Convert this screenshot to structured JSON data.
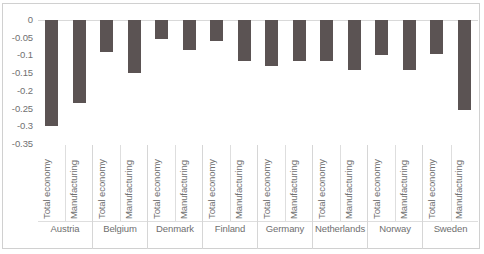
{
  "chart_data": {
    "type": "bar",
    "title": "",
    "subtitle": "",
    "xlabel": "",
    "ylabel": "",
    "ylim": [
      -0.35,
      0
    ],
    "yticks": [
      "0",
      "-0.05",
      "-0.1",
      "-0.15",
      "-0.2",
      "-0.25",
      "-0.3",
      "-0.35"
    ],
    "ytick_values": [
      0,
      -0.05,
      -0.1,
      -0.15,
      -0.2,
      -0.25,
      -0.3,
      -0.35
    ],
    "grid": false,
    "legend": "none",
    "bar_color": "#5b5353",
    "categories": [
      "Austria",
      "Belgium",
      "Denmark",
      "Finland",
      "Germany",
      "Netherlands",
      "Norway",
      "Sweden"
    ],
    "subcategories": [
      "Total economy",
      "Manufacturing"
    ],
    "series": [
      {
        "name": "Total economy",
        "values": [
          -0.3,
          -0.09,
          -0.055,
          -0.06,
          -0.13,
          -0.115,
          -0.1,
          -0.095
        ]
      },
      {
        "name": "Manufacturing",
        "values": [
          -0.235,
          -0.15,
          -0.085,
          -0.115,
          -0.115,
          -0.14,
          -0.14,
          -0.255
        ]
      }
    ],
    "groups": [
      {
        "label": "Austria",
        "bars": [
          {
            "label": "Total economy",
            "value": -0.3
          },
          {
            "label": "Manufacturing",
            "value": -0.235
          }
        ]
      },
      {
        "label": "Belgium",
        "bars": [
          {
            "label": "Total economy",
            "value": -0.09
          },
          {
            "label": "Manufacturing",
            "value": -0.15
          }
        ]
      },
      {
        "label": "Denmark",
        "bars": [
          {
            "label": "Total economy",
            "value": -0.055
          },
          {
            "label": "Manufacturing",
            "value": -0.085
          }
        ]
      },
      {
        "label": "Finland",
        "bars": [
          {
            "label": "Total economy",
            "value": -0.06
          },
          {
            "label": "Manufacturing",
            "value": -0.115
          }
        ]
      },
      {
        "label": "Germany",
        "bars": [
          {
            "label": "Total economy",
            "value": -0.13
          },
          {
            "label": "Manufacturing",
            "value": -0.115
          }
        ]
      },
      {
        "label": "Netherlands",
        "bars": [
          {
            "label": "Total economy",
            "value": -0.115
          },
          {
            "label": "Manufacturing",
            "value": -0.14
          }
        ]
      },
      {
        "label": "Norway",
        "bars": [
          {
            "label": "Total economy",
            "value": -0.1
          },
          {
            "label": "Manufacturing",
            "value": -0.14
          }
        ]
      },
      {
        "label": "Sweden",
        "bars": [
          {
            "label": "Total economy",
            "value": -0.095
          },
          {
            "label": "Manufacturing",
            "value": -0.255
          }
        ]
      }
    ]
  }
}
